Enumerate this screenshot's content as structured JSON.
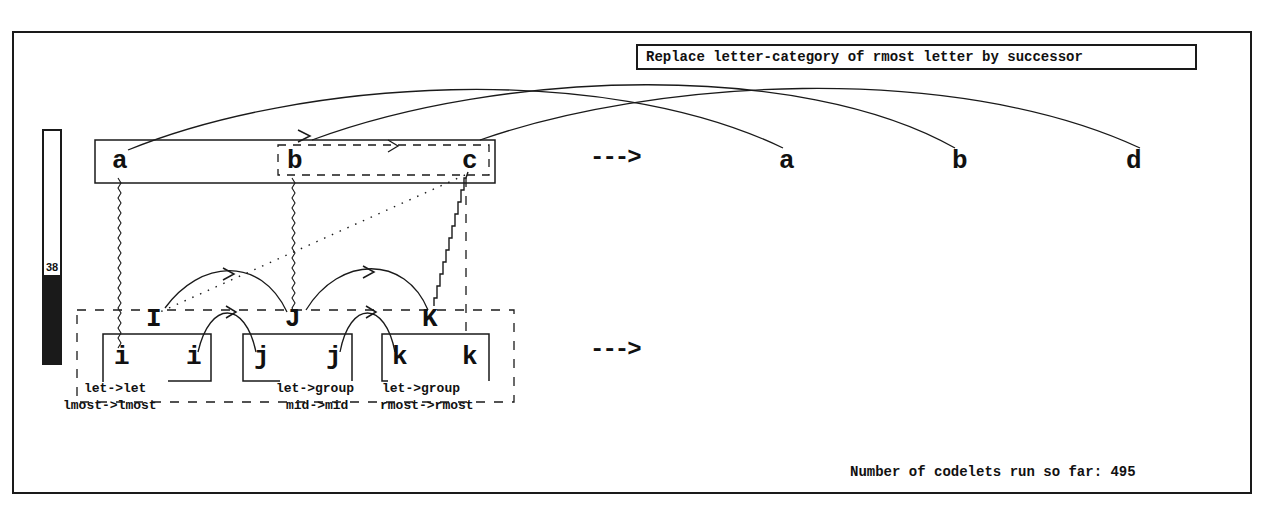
{
  "rule": {
    "text": "Replace letter-category of rmost letter by successor"
  },
  "temperature": {
    "value": "38",
    "percent": 38
  },
  "initial_string": {
    "letters": [
      "a",
      "b",
      "c"
    ]
  },
  "modified_string": {
    "letters": [
      "a",
      "b",
      "d"
    ]
  },
  "target_string": {
    "letters": [
      "i",
      "i",
      "j",
      "j",
      "k",
      "k"
    ],
    "group_letters": [
      "I",
      "J",
      "K"
    ]
  },
  "answer_string": {
    "letters": []
  },
  "arrows": {
    "top": "--->",
    "bottom": "--->"
  },
  "correspondence_labels": [
    {
      "line1": "let->let",
      "line2": "lmost->lmost"
    },
    {
      "line1": "let->group",
      "line2": "mid->mid"
    },
    {
      "line1": "let->group",
      "line2": "rmost->rmost"
    }
  ],
  "status": {
    "codelets_text": "Number of codelets run so far: 495",
    "codelets_count": 495
  }
}
